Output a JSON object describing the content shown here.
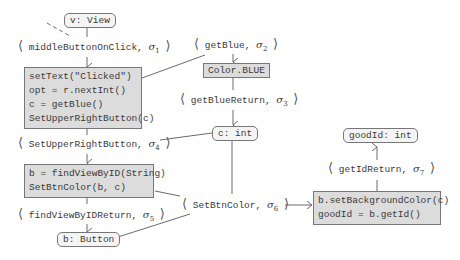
{
  "nodes": {
    "v_view": "v: View",
    "block1": [
      "setText(\"Clicked\")",
      "opt = r.nextInt()",
      "c = getBlue()",
      "SetUpperRightButton(c)"
    ],
    "color_blue": "Color.BLUE",
    "c_int": "c: int",
    "block2": [
      "b = findViewByID(String)",
      "SetBtnColor(b, c)"
    ],
    "b_button": "b: Button",
    "block3": [
      "b.setBackgroundColor(c)",
      "goodId = b.getId()"
    ],
    "goodid_int": "goodId: int"
  },
  "labels": {
    "l1": {
      "event": "middleButtonOnClick,",
      "sigma": "σ",
      "index": "1"
    },
    "l2": {
      "event": "getBlue,",
      "sigma": "σ",
      "index": "2"
    },
    "l3": {
      "event": "getBlueReturn,",
      "sigma": "σ",
      "index": "3"
    },
    "l4": {
      "event": "SetUpperRightButton,",
      "sigma": "σ",
      "index": "4"
    },
    "l5": {
      "event": "findViewByIDReturn,",
      "sigma": "σ",
      "index": "5"
    },
    "l6": {
      "event": "SetBtnColor,",
      "sigma": "σ",
      "index": "6"
    },
    "l7": {
      "event": "getIdReturn,",
      "sigma": "σ",
      "index": "7"
    }
  },
  "brackets": {
    "open": "⟨",
    "close": "⟩"
  },
  "colors": {
    "edge": "#6a6a6a",
    "block_fill": "#dcdcdc",
    "rounded_fill": "#f4f4f4",
    "border": "#777777"
  }
}
